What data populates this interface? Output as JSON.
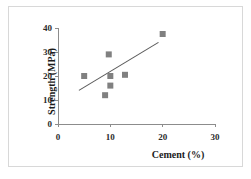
{
  "chart_data": {
    "type": "scatter",
    "title": "",
    "xlabel": "Cement (%)",
    "ylabel": "Strength (MPa)",
    "xlim": [
      0,
      30
    ],
    "ylim": [
      0,
      40
    ],
    "xticks": [
      0,
      10,
      20,
      30
    ],
    "yticks": [
      0,
      10,
      20,
      30,
      40
    ],
    "grid": false,
    "legend": null,
    "marker": {
      "shape": "square",
      "color": "#808080",
      "size": 6
    },
    "points": [
      {
        "x": 5.0,
        "y": 20.0
      },
      {
        "x": 9.0,
        "y": 12.0
      },
      {
        "x": 9.7,
        "y": 29.0
      },
      {
        "x": 10.0,
        "y": 20.0
      },
      {
        "x": 10.0,
        "y": 16.0
      },
      {
        "x": 12.8,
        "y": 20.5
      },
      {
        "x": 20.0,
        "y": 37.5
      }
    ],
    "trendline": {
      "type": "linear",
      "color": "#5a5a5a",
      "x_start": 4.0,
      "y_start": 14.0,
      "x_end": 19.2,
      "y_end": 34.0
    },
    "axis_color": "#8c8c8c"
  },
  "axis": {
    "x_tick_labels": [
      "0",
      "10",
      "20",
      "30"
    ],
    "y_tick_labels": [
      "0",
      "10",
      "20",
      "30",
      "40"
    ],
    "x_title": "Cement (%)",
    "y_title": "Strength (MPa)"
  }
}
